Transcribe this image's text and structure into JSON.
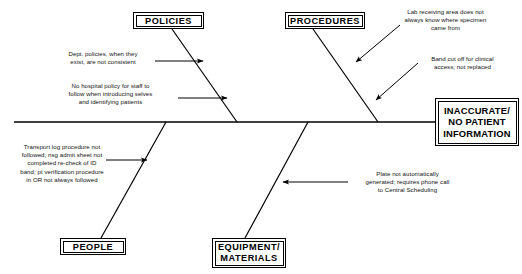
{
  "diagram": {
    "type": "fishbone-ishikawa",
    "effect": {
      "line1": "INACCURATE/",
      "line2": "NO PATIENT",
      "line3": "INFORMATION"
    },
    "categories": [
      {
        "id": "policies",
        "label": "POLICIES",
        "position": "top-left"
      },
      {
        "id": "procedures",
        "label": "PROCEDURES",
        "position": "top-right"
      },
      {
        "id": "people",
        "label": "PEOPLE",
        "position": "bottom-left"
      },
      {
        "id": "equipment-materials",
        "label_line1": "EQUIPMENT/",
        "label_line2": "MATERIALS",
        "position": "bottom-right"
      }
    ],
    "causes": [
      {
        "id": "cause-dept-policies",
        "category": "policies",
        "text": "Dept. policies, when they\nexist, are not consistent"
      },
      {
        "id": "cause-no-hospital-policy",
        "category": "policies",
        "text": "No hospital policy for staff to\nfollow when introducing selves\nand identifying patients"
      },
      {
        "id": "cause-lab-receiving",
        "category": "procedures",
        "text": "Lab receiving area does not\nalways know where specimen\ncame from"
      },
      {
        "id": "cause-band-cut-off",
        "category": "procedures",
        "text": "Band cut off for clinical\naccess; not replaced"
      },
      {
        "id": "cause-transport-log",
        "category": "people",
        "text": "Transport log procedure not\nfollowed; nsg admit sheet not\ncompleted re-check of ID\nband; pt verification procedure\nin OR not always followed"
      },
      {
        "id": "cause-plate-not-generated",
        "category": "equipment-materials",
        "text": "Plate not automatically\ngenerated; requires phone call\nto Central Scheduling"
      }
    ],
    "colors": {
      "stroke": "#000000",
      "background": "#ffffff",
      "text": "#000000"
    }
  }
}
